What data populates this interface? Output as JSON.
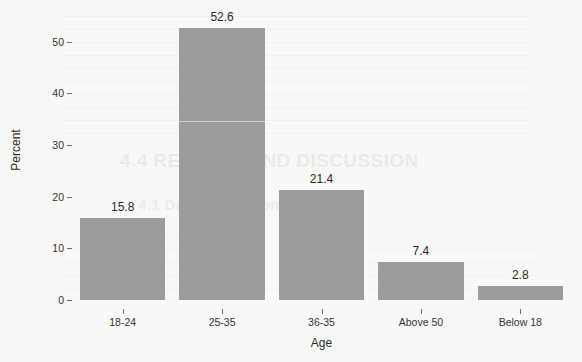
{
  "chart_data": {
    "type": "bar",
    "title": "",
    "subtitle": "",
    "xlabel": "Age",
    "ylabel": "Percent",
    "categories": [
      "18-24",
      "25-35",
      "36-35",
      "Above 50",
      "Below 18"
    ],
    "values": [
      15.8,
      52.6,
      21.4,
      7.4,
      2.8
    ],
    "value_labels": [
      "15.8",
      "52.6",
      "21.4",
      "7.4",
      "2.8"
    ],
    "ylim": [
      0,
      55
    ],
    "yticks": [
      0,
      10,
      20,
      30,
      40,
      50
    ],
    "ytick_labels": [
      "0",
      "10",
      "20",
      "30",
      "40",
      "50"
    ],
    "grid": false,
    "legend": false,
    "legend_position": "none",
    "bar_color": "#9c9c9c",
    "background_color": "#f8f8f7",
    "axis_text_color": "#343434"
  },
  "watermark": {
    "heading": "4.4 RESULTS AND DISCUSSION",
    "subheading": "4.1 Data Collection"
  }
}
